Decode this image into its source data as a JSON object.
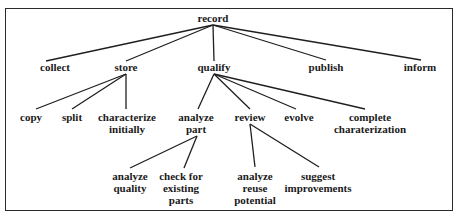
{
  "diagram": {
    "type": "tree",
    "root": "record",
    "nodes": {
      "record": {
        "label": [
          "record"
        ],
        "x": 213,
        "y": 12
      },
      "collect": {
        "label": [
          "collect"
        ],
        "x": 55,
        "y": 61
      },
      "store": {
        "label": [
          "store"
        ],
        "x": 126,
        "y": 61
      },
      "qualify": {
        "label": [
          "qualify"
        ],
        "x": 214,
        "y": 61
      },
      "publish": {
        "label": [
          "publish"
        ],
        "x": 326,
        "y": 61
      },
      "inform": {
        "label": [
          "inform"
        ],
        "x": 420,
        "y": 61
      },
      "copy": {
        "label": [
          "copy"
        ],
        "x": 31,
        "y": 111
      },
      "split": {
        "label": [
          "split"
        ],
        "x": 72,
        "y": 111
      },
      "characterize_initially": {
        "label": [
          "characterize",
          "initially"
        ],
        "x": 127,
        "y": 111
      },
      "analyze_part": {
        "label": [
          "analyze",
          "part"
        ],
        "x": 196,
        "y": 111
      },
      "review": {
        "label": [
          "review"
        ],
        "x": 250,
        "y": 111
      },
      "evolve": {
        "label": [
          "evolve"
        ],
        "x": 299,
        "y": 111
      },
      "complete_charaterization": {
        "label": [
          "complete",
          "charaterization"
        ],
        "x": 370,
        "y": 111
      },
      "analyze_quality": {
        "label": [
          "analyze",
          "quality"
        ],
        "x": 130,
        "y": 170
      },
      "check_for_existing_parts": {
        "label": [
          "check for",
          "existing",
          "parts"
        ],
        "x": 181,
        "y": 170
      },
      "analyze_reuse_potential": {
        "label": [
          "analyze",
          "reuse",
          "potential"
        ],
        "x": 255,
        "y": 170
      },
      "suggest_improvements": {
        "label": [
          "suggest",
          "improvements"
        ],
        "x": 318,
        "y": 170
      }
    },
    "edges": [
      {
        "from": [
          213,
          25
        ],
        "to": [
          46,
          61
        ]
      },
      {
        "from": [
          213,
          25
        ],
        "to": [
          126,
          61
        ]
      },
      {
        "from": [
          213,
          25
        ],
        "to": [
          214,
          61
        ]
      },
      {
        "from": [
          213,
          25
        ],
        "to": [
          326,
          60
        ]
      },
      {
        "from": [
          213,
          25
        ],
        "to": [
          421,
          60
        ]
      },
      {
        "from": [
          126,
          74
        ],
        "to": [
          36,
          109
        ]
      },
      {
        "from": [
          126,
          74
        ],
        "to": [
          72,
          109
        ]
      },
      {
        "from": [
          126,
          74
        ],
        "to": [
          126,
          109
        ]
      },
      {
        "from": [
          214,
          74
        ],
        "to": [
          198,
          109
        ]
      },
      {
        "from": [
          214,
          74
        ],
        "to": [
          250,
          109
        ]
      },
      {
        "from": [
          214,
          74
        ],
        "to": [
          296,
          109
        ]
      },
      {
        "from": [
          214,
          74
        ],
        "to": [
          365,
          109
        ]
      },
      {
        "from": [
          197,
          136
        ],
        "to": [
          130,
          168
        ]
      },
      {
        "from": [
          197,
          136
        ],
        "to": [
          184,
          168
        ]
      },
      {
        "from": [
          250,
          124
        ],
        "to": [
          255,
          167
        ]
      },
      {
        "from": [
          250,
          124
        ],
        "to": [
          319,
          167
        ]
      }
    ],
    "colors": {
      "line": "#1f1f1f",
      "text": "#1a1a1a",
      "background": "#ffffff"
    }
  }
}
